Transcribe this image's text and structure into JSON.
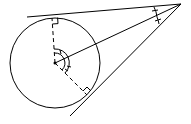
{
  "diagram": {
    "type": "geometry",
    "colors": {
      "stroke": "#000000",
      "background": "#ffffff"
    },
    "circle": {
      "cx": 55,
      "cy": 63,
      "r": 45
    },
    "external_point": {
      "x": 181,
      "y": 4
    },
    "tangent_points": [
      {
        "x": 52,
        "y": 18
      },
      {
        "x": 87,
        "y": 95
      }
    ],
    "tangent_lines": [
      {
        "x1": 27,
        "y1": 17,
        "x2": 181,
        "y2": 4
      },
      {
        "x1": 181,
        "y1": 4,
        "x2": 70,
        "y2": 116
      }
    ],
    "center_to_external": {
      "x1": 55,
      "y1": 63,
      "x2": 181,
      "y2": 4
    },
    "radii_dashed": [
      {
        "x1": 55,
        "y1": 63,
        "x2": 52,
        "y2": 18
      },
      {
        "x1": 55,
        "y1": 63,
        "x2": 87,
        "y2": 95
      }
    ],
    "markers": {
      "right_angles": 2,
      "center_angle_arcs": "double arcs with tick marks (equal angles)",
      "external_angle_marks": "double tick marks (equal angles)"
    }
  }
}
